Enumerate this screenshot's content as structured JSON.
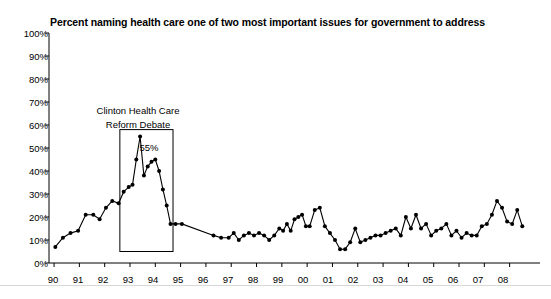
{
  "chart": {
    "title": "Percent naming health care one of two most important issues for government to address",
    "annotation_line1": "Clinton Health Care",
    "annotation_line2": "Reform Debate",
    "peak_label": "55%"
  },
  "chart_data": {
    "type": "line",
    "title": "Percent naming health care one of two most important issues for government to address",
    "xlabel": "",
    "ylabel": "",
    "ylim": [
      0,
      100
    ],
    "ytick_labels": [
      "0%",
      "10%",
      "20%",
      "30%",
      "40%",
      "50%",
      "60%",
      "70%",
      "80%",
      "90%",
      "100%"
    ],
    "ytick_values": [
      0,
      10,
      20,
      30,
      40,
      50,
      60,
      70,
      80,
      90,
      100
    ],
    "xtick_labels": [
      "90",
      "91",
      "92",
      "93",
      "94",
      "95",
      "96",
      "97",
      "98",
      "99",
      "00",
      "01",
      "02",
      "03",
      "04",
      "05",
      "06",
      "07",
      "08"
    ],
    "grid": false,
    "markers": true,
    "line_color": "#000000",
    "marker_color": "#000000",
    "annotations": [
      {
        "text": "Clinton Health Care Reform Debate",
        "box_x_range": [
          92.6,
          94.7
        ],
        "box_y_range": [
          5,
          58
        ]
      },
      {
        "text": "55%",
        "x": 93.4,
        "y": 55
      }
    ],
    "x": [
      90.05,
      90.35,
      90.65,
      90.95,
      91.25,
      91.55,
      91.8,
      92.05,
      92.3,
      92.55,
      92.75,
      92.95,
      93.1,
      93.25,
      93.4,
      93.55,
      93.7,
      93.85,
      94.0,
      94.15,
      94.3,
      94.45,
      94.6,
      94.8,
      95.05,
      96.3,
      96.6,
      96.9,
      97.1,
      97.3,
      97.5,
      97.7,
      97.9,
      98.1,
      98.3,
      98.5,
      98.7,
      98.9,
      99.05,
      99.2,
      99.35,
      99.5,
      99.65,
      99.8,
      99.95,
      100.1,
      100.3,
      100.5,
      100.7,
      100.9,
      101.1,
      101.3,
      101.5,
      101.7,
      101.9,
      102.1,
      102.3,
      102.5,
      102.7,
      102.9,
      103.1,
      103.3,
      103.5,
      103.7,
      103.9,
      104.1,
      104.3,
      104.5,
      104.7,
      104.9,
      105.1,
      105.3,
      105.5,
      105.7,
      105.9,
      106.1,
      106.3,
      106.5,
      106.7,
      106.9,
      107.1,
      107.3,
      107.5,
      107.7,
      107.9,
      108.1,
      108.3,
      108.5
    ],
    "values": [
      7,
      11,
      13,
      14,
      21,
      21,
      19,
      24,
      27,
      26,
      31,
      33,
      34,
      45,
      55,
      38,
      42,
      44,
      45,
      40,
      32,
      25,
      17,
      17,
      17,
      12,
      11,
      11,
      13,
      10,
      12,
      13,
      12,
      13,
      12,
      10,
      12,
      15,
      14,
      17,
      14,
      19,
      20,
      21,
      16,
      16,
      23,
      24,
      16,
      13,
      10,
      6,
      6,
      9,
      15,
      9,
      10,
      11,
      12,
      12,
      13,
      14,
      15,
      12,
      20,
      15,
      21,
      15,
      17,
      12,
      14,
      15,
      17,
      12,
      14,
      11,
      13,
      12,
      12,
      16,
      17,
      21,
      27,
      24,
      18,
      17,
      23,
      16
    ],
    "series_note": "Single black line with circular markers, trend: rises to 55% peak in 1993 then declines"
  }
}
